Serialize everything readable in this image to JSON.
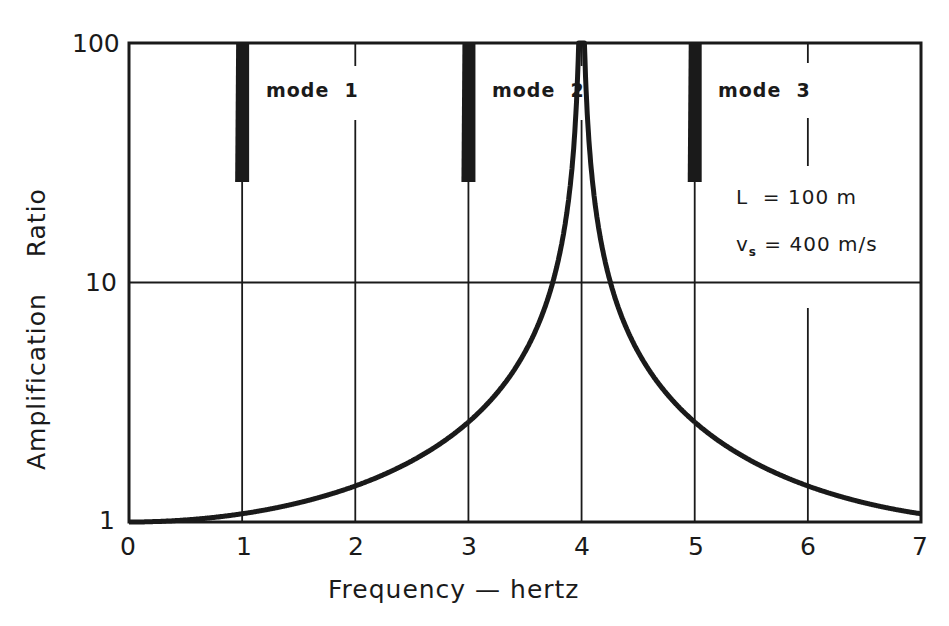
{
  "chart_data": {
    "type": "line",
    "title": "",
    "xlabel": "Frequency — hertz",
    "ylabel": "Amplification    Ratio",
    "xlim": [
      0,
      7
    ],
    "ylim": [
      1,
      100
    ],
    "yscale": "log",
    "grid": true,
    "x_ticks": [
      "0",
      "1",
      "2",
      "3",
      "4",
      "5",
      "6",
      "7"
    ],
    "y_ticks": [
      "1",
      "10",
      "100"
    ],
    "formula": "A(f) = 1 / |cos(pi * f * L / (2 * vs))|",
    "parameters": {
      "L_m": 100,
      "vs_m_per_s": 400,
      "fundamental_hz": 1.0
    },
    "series": [
      {
        "name": "Amplification ratio",
        "x": [
          0,
          0.25,
          0.5,
          0.75,
          0.9,
          0.95,
          0.98,
          1.0,
          1.02,
          1.05,
          1.1,
          1.25,
          1.5,
          1.75,
          2.0,
          2.25,
          2.5,
          2.75,
          2.9,
          2.95,
          2.98,
          3.0,
          3.02,
          3.05,
          3.1,
          3.25,
          3.5,
          3.75,
          4.0,
          4.25,
          4.5,
          4.75,
          4.9,
          4.95,
          4.98,
          5.0,
          5.02,
          5.05,
          5.1,
          5.25,
          5.5,
          5.75,
          6.0,
          6.25,
          6.5,
          6.75,
          6.9,
          7.0
        ],
        "y": [
          1.0,
          1.08,
          1.41,
          2.61,
          6.39,
          12.7,
          31.8,
          100,
          31.8,
          12.7,
          6.39,
          2.61,
          1.41,
          1.08,
          1.0,
          1.08,
          1.41,
          2.61,
          6.39,
          12.7,
          31.8,
          100,
          31.8,
          12.7,
          6.39,
          2.61,
          1.41,
          1.08,
          1.0,
          1.08,
          1.41,
          2.61,
          6.39,
          12.7,
          31.8,
          100,
          31.8,
          12.7,
          6.39,
          2.61,
          1.41,
          1.08,
          1.0,
          1.08,
          1.41,
          2.61,
          6.39,
          11
        ]
      }
    ],
    "annotations": [
      {
        "text": "mode 1",
        "x": 1.2,
        "y": 60
      },
      {
        "text": "mode 2",
        "x": 3.2,
        "y": 60
      },
      {
        "text": "mode 3",
        "x": 5.2,
        "y": 60
      },
      {
        "text": "L  = 100 m",
        "x": 5.35,
        "y": 22
      },
      {
        "text": "vs = 400 m/s",
        "x": 5.35,
        "y": 14
      }
    ]
  },
  "labels": {
    "y_axis": "Amplification    Ratio",
    "x_axis": "Frequency — hertz",
    "mode1": "mode  1",
    "mode2": "mode  2",
    "mode3": "mode  3",
    "param_L": "L  = 100 m",
    "param_vs_v": "v",
    "param_vs_sub": "s",
    "param_vs_rest": " = 400 m/s",
    "x_ticks": [
      "0",
      "1",
      "2",
      "3",
      "4",
      "5",
      "6",
      "7"
    ],
    "y_ticks": [
      "1",
      "10",
      "100"
    ]
  }
}
